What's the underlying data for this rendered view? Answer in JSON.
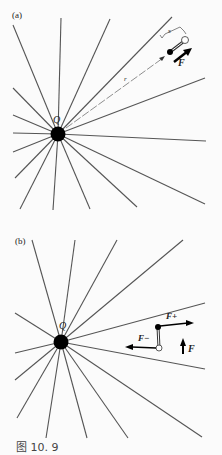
{
  "figure": {
    "caption": "图 10. 9",
    "panel_a": {
      "label": "(a)",
      "charge_label": "Q",
      "distance_label": "r",
      "separation_label": "s",
      "force_label": "F"
    },
    "panel_b": {
      "label": "(b)",
      "charge_label": "Q",
      "force_plus_label": "F+",
      "force_minus_label": "F−",
      "net_force_label": "F"
    },
    "colors": {
      "line": "#555555",
      "charge": "#000000",
      "background": "#fbfbfb"
    }
  }
}
